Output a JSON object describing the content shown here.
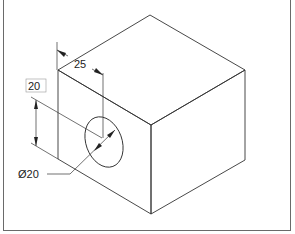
{
  "figure": {
    "type": "isometric-drawing",
    "line_color": "#333333"
  },
  "dimensions": {
    "hole_offset_horizontal": "25",
    "hole_offset_vertical": "20",
    "hole_diameter": "Ø20",
    "diameter_symbol": "Ø",
    "diameter_value": "20"
  }
}
